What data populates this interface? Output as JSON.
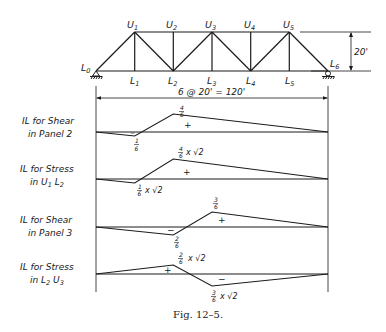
{
  "figure": {
    "caption": "Fig. 12-5.",
    "truss": {
      "lower_nodes": [
        "L0",
        "L1",
        "L2",
        "L3",
        "L4",
        "L5",
        "L6"
      ],
      "upper_nodes": [
        "U1",
        "U2",
        "U3",
        "U4",
        "U5"
      ],
      "height_label": "20'",
      "span_label": "6 @ 20' = 120'"
    },
    "influence_lines": [
      {
        "title_line1": "IL for Shear",
        "title_line2": "in Panel 2",
        "max_label": "4/6",
        "min_label": "1/6",
        "pos_sign": "+",
        "neg_sign": "-"
      },
      {
        "title_line1": "IL for Stress",
        "title_line2": "in U1 L2",
        "max_label": "4/6 x √2",
        "min_label": "1/6 x √2",
        "pos_sign": "+"
      },
      {
        "title_line1": "IL for Shear",
        "title_line2": "in Panel 3",
        "max_label": "3/6",
        "min_label": "2/6",
        "pos_sign": "+",
        "neg_sign": "-"
      },
      {
        "title_line1": "IL for Stress",
        "title_line2": "in L2 U3",
        "max_label": "2/6 x √2",
        "min_label": "3/6 x √2",
        "pos_sign": "+",
        "neg_sign": "-"
      }
    ]
  },
  "text": {
    "L0": "L",
    "L0s": "0",
    "L1": "L",
    "L1s": "1",
    "L2": "L",
    "L2s": "2",
    "L3": "L",
    "L3s": "3",
    "L4": "L",
    "L4s": "4",
    "L5": "L",
    "L5s": "5",
    "L6": "L",
    "L6s": "6",
    "U1": "U",
    "U1s": "1",
    "U2": "U",
    "U2s": "2",
    "U3": "U",
    "U3s": "3",
    "U4": "U",
    "U4s": "4",
    "U5": "U",
    "U5s": "5",
    "height": "20'",
    "span": "6 @ 20' = 120'",
    "il1_t1": "IL for Shear",
    "il1_t2": "in Panel 2",
    "il1_max_num": "4",
    "il1_max_den": "6",
    "il1_min_num": "1",
    "il1_min_den": "6",
    "il2_t1": "IL for Stress",
    "il2_t2a": "in U",
    "il2_t2b": "1",
    "il2_t2c": " L",
    "il2_t2d": "2",
    "il2_max_num": "4",
    "il2_max_den": "6",
    "il2_max_tail": "x √2",
    "il2_min_num": "1",
    "il2_min_den": "6",
    "il2_min_tail": "x √2",
    "il3_t1": "IL for Shear",
    "il3_t2": "in Panel 3",
    "il3_max_num": "3",
    "il3_max_den": "6",
    "il3_min_num": "2",
    "il3_min_den": "6",
    "il4_t1": "IL for Stress",
    "il4_t2a": "in L",
    "il4_t2b": "2",
    "il4_t2c": " U",
    "il4_t2d": "3",
    "il4_max_num": "2",
    "il4_max_den": "6",
    "il4_max_tail": "x √2",
    "il4_min_num": "3",
    "il4_min_den": "6",
    "il4_min_tail": "x √2",
    "plus": "+",
    "minus": "−",
    "caption": "Fig. 12–5."
  }
}
